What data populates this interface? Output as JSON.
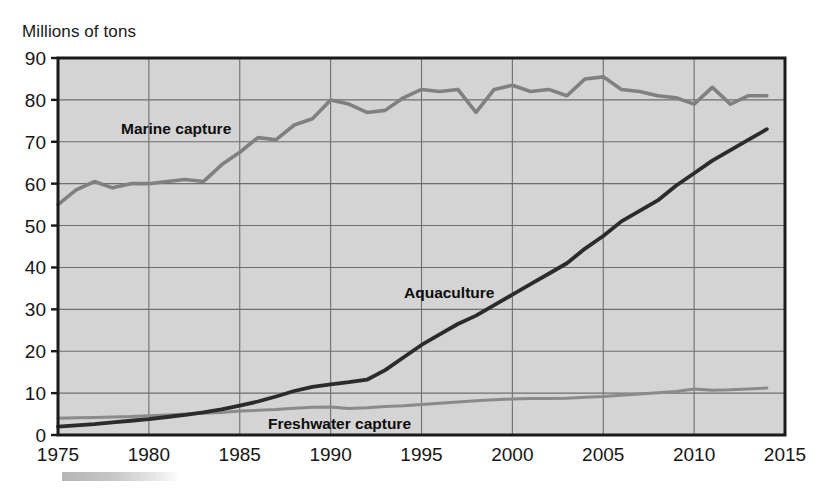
{
  "axis_title": "Millions of tons",
  "colors": {
    "plot_background": "#d4d4d4",
    "grid": "#6e6e6e",
    "frame": "#1a1a1a",
    "marine": "#808080",
    "freshwater": "#8a8a8a",
    "aquaculture": "#2b2b2b",
    "text": "#161616"
  },
  "labels": {
    "marine": "Marine capture",
    "aquaculture": "Aquaculture",
    "freshwater": "Freshwater capture"
  },
  "chart_data": {
    "type": "line",
    "title": "",
    "subtitle": "",
    "xlabel": "",
    "ylabel": "Millions of tons",
    "xlim": [
      1975,
      2015
    ],
    "ylim": [
      0,
      90
    ],
    "xticks": [
      1975,
      1980,
      1985,
      1990,
      1995,
      2000,
      2005,
      2010,
      2015
    ],
    "yticks": [
      0,
      10,
      20,
      30,
      40,
      50,
      60,
      70,
      80,
      90
    ],
    "grid": true,
    "legend": "inline-annotations",
    "x": [
      1975,
      1976,
      1977,
      1978,
      1979,
      1980,
      1981,
      1982,
      1983,
      1984,
      1985,
      1986,
      1987,
      1988,
      1989,
      1990,
      1991,
      1992,
      1993,
      1994,
      1995,
      1996,
      1997,
      1998,
      1999,
      2000,
      2001,
      2002,
      2003,
      2004,
      2005,
      2006,
      2007,
      2008,
      2009,
      2010,
      2011,
      2012,
      2013,
      2014
    ],
    "series": [
      {
        "name": "Marine capture",
        "color": "#808080",
        "values": [
          55.0,
          58.5,
          60.5,
          59.0,
          60.0,
          60.0,
          60.5,
          61.0,
          60.5,
          64.5,
          67.5,
          71.0,
          70.5,
          74.0,
          75.5,
          80.0,
          79.0,
          77.0,
          77.5,
          80.5,
          82.5,
          82.0,
          82.5,
          77.0,
          82.5,
          83.5,
          82.0,
          82.5,
          81.0,
          85.0,
          85.5,
          82.5,
          82.0,
          81.0,
          80.5,
          79.0,
          83.0,
          79.0,
          81.0,
          81.0
        ]
      },
      {
        "name": "Aquaculture",
        "color": "#2b2b2b",
        "values": [
          2.0,
          2.3,
          2.6,
          3.0,
          3.4,
          3.8,
          4.3,
          4.8,
          5.4,
          6.1,
          7.0,
          8.0,
          9.2,
          10.5,
          11.5,
          12.1,
          12.6,
          13.2,
          15.5,
          18.5,
          21.5,
          24.0,
          26.5,
          28.5,
          31.0,
          33.5,
          36.0,
          38.5,
          41.0,
          44.5,
          47.5,
          51.0,
          53.5,
          56.0,
          59.5,
          62.5,
          65.5,
          68.0,
          70.5,
          73.0
        ]
      },
      {
        "name": "Freshwater capture",
        "color": "#8a8a8a",
        "values": [
          4.0,
          4.1,
          4.2,
          4.3,
          4.4,
          4.6,
          4.8,
          5.0,
          5.2,
          5.4,
          5.7,
          5.9,
          6.1,
          6.4,
          6.6,
          6.7,
          6.3,
          6.5,
          6.8,
          7.0,
          7.3,
          7.6,
          7.9,
          8.2,
          8.4,
          8.6,
          8.7,
          8.7,
          8.8,
          9.0,
          9.2,
          9.5,
          9.8,
          10.1,
          10.4,
          11.0,
          10.7,
          10.8,
          11.0,
          11.2
        ]
      }
    ]
  }
}
